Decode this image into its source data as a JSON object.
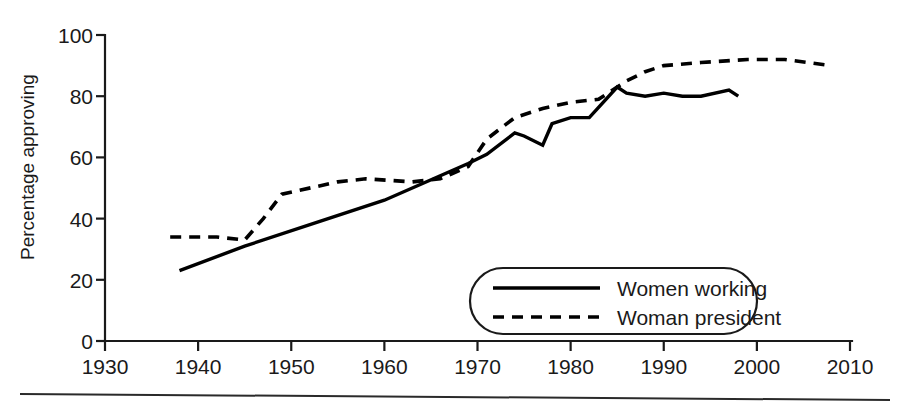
{
  "chart_data": {
    "type": "line",
    "title": "",
    "subtitle": "",
    "xlabel": "",
    "ylabel": "Percentage approving",
    "xlim": [
      1930,
      2010
    ],
    "ylim": [
      0,
      100
    ],
    "grid": false,
    "legend_position": "bottom-right",
    "x_ticks": [
      1930,
      1940,
      1950,
      1960,
      1970,
      1980,
      1990,
      2000,
      2010
    ],
    "x_tick_labels": [
      "1930",
      "1940",
      "1950",
      "1960",
      "1970",
      "1980",
      "1990",
      "2000",
      "2010"
    ],
    "y_ticks": [
      0,
      20,
      40,
      60,
      80,
      100
    ],
    "y_tick_labels": [
      "0",
      "20",
      "40",
      "60",
      "80",
      "100"
    ],
    "series": [
      {
        "name": "Women working",
        "style": "solid",
        "color": "#000000",
        "points": [
          [
            1938,
            23
          ],
          [
            1945,
            31
          ],
          [
            1952,
            38
          ],
          [
            1960,
            46
          ],
          [
            1966,
            54
          ],
          [
            1969,
            58
          ],
          [
            1971,
            61
          ],
          [
            1974,
            68
          ],
          [
            1975,
            67
          ],
          [
            1977,
            64
          ],
          [
            1978,
            71
          ],
          [
            1980,
            73
          ],
          [
            1982,
            73
          ],
          [
            1985,
            83
          ],
          [
            1986,
            81
          ],
          [
            1988,
            80
          ],
          [
            1990,
            81
          ],
          [
            1992,
            80
          ],
          [
            1994,
            80
          ],
          [
            1997,
            82
          ],
          [
            1998,
            80
          ]
        ]
      },
      {
        "name": "Woman president",
        "style": "dashed",
        "color": "#000000",
        "points": [
          [
            1937,
            34
          ],
          [
            1942,
            34
          ],
          [
            1945,
            33
          ],
          [
            1947,
            40
          ],
          [
            1949,
            48
          ],
          [
            1955,
            52
          ],
          [
            1958,
            53
          ],
          [
            1963,
            52
          ],
          [
            1966,
            53
          ],
          [
            1969,
            57
          ],
          [
            1971,
            66
          ],
          [
            1974,
            73
          ],
          [
            1977,
            76
          ],
          [
            1980,
            78
          ],
          [
            1983,
            79
          ],
          [
            1986,
            85
          ],
          [
            1988,
            88
          ],
          [
            1990,
            90
          ],
          [
            1994,
            91
          ],
          [
            1999,
            92
          ],
          [
            2003,
            92
          ],
          [
            2008,
            90
          ]
        ]
      }
    ],
    "legend_entries": [
      {
        "label": "Women working",
        "style": "solid"
      },
      {
        "label": "Woman president",
        "style": "dashed"
      }
    ]
  }
}
